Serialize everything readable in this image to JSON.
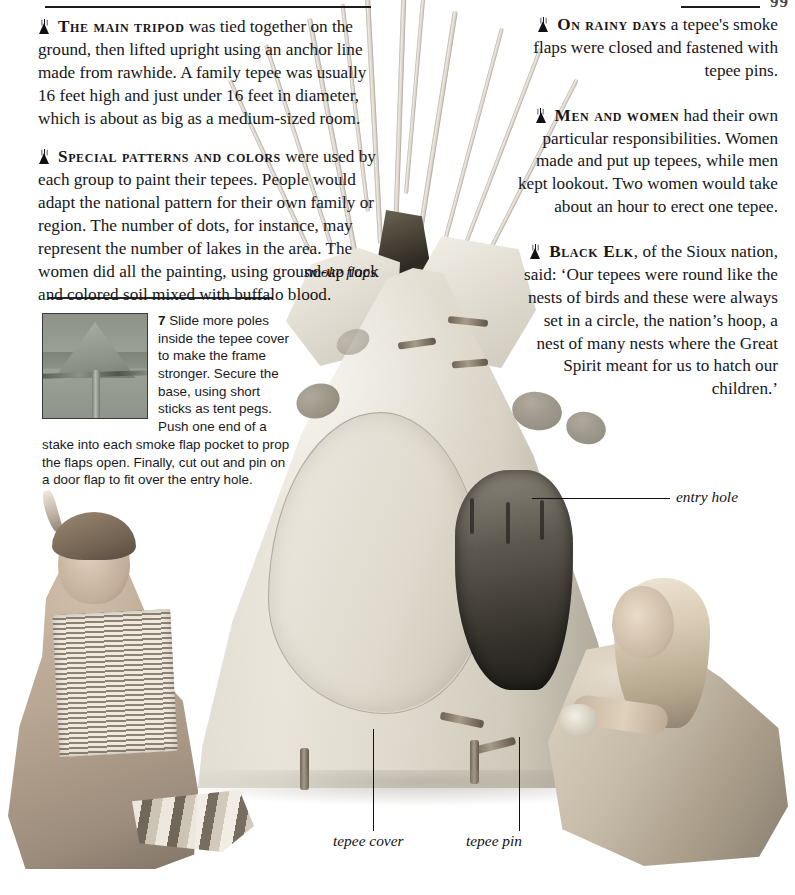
{
  "page": {
    "folio": "99",
    "bullet_icon": "tepee-icon"
  },
  "left_column": {
    "paragraphs": [
      {
        "lead": "The main tripod",
        "body": " was tied together on the ground, then lifted upright using an anchor line made from rawhide. A family tepee was usually 16 feet high and just under 16 feet in diameter, which is about as big as a medium-sized room."
      },
      {
        "lead": "Special patterns and colors",
        "body": " were used by each group to paint their tepees. People would adapt the national pattern for their own family or region. The number of dots, for instance, may represent the number of lakes in the area. The women did all the painting, using ground-up rock and colored soil mixed with buffalo blood."
      }
    ]
  },
  "right_column": {
    "paragraphs": [
      {
        "lead": "On rainy days",
        "body": " a tepee's smoke flaps were closed and fastened with tepee pins."
      },
      {
        "lead": "Men and women",
        "body": " had their own particular responsibilities. Women made and put up tepees, while men kept lookout. Two women would take about an hour to erect one tepee."
      },
      {
        "lead": "Black Elk",
        "body": ", of the Sioux nation, said: ‘Our tepees were round like the nests of birds and these were always set in a circle, the nation’s hoop, a nest of many nests where the Great Spirit meant for us to hatch our children.’"
      }
    ]
  },
  "step": {
    "number": "7",
    "text": " Slide more poles inside the tepee cover to make the frame stronger. Secure the base, using short sticks as tent pegs. Push one end of a stake into each smoke flap pocket to prop the flaps open. Finally, cut out and pin on a door flap to fit over the entry hole.",
    "thumb_caption": "tepee-top-photo"
  },
  "callouts": [
    {
      "name": "smoke-flaps",
      "label": "smoke flaps"
    },
    {
      "name": "entry-hole",
      "label": "entry hole"
    },
    {
      "name": "tepee-cover",
      "label": "tepee cover"
    },
    {
      "name": "tepee-pin",
      "label": "tepee pin"
    }
  ],
  "photo": {
    "subject": "model tepee with two children in Native American dress",
    "colors": {
      "cover": "#e4dfd3",
      "painted_dot": "#8e887a",
      "pole": "#dfd9cd",
      "entry_shadow": "#2b2823"
    }
  }
}
